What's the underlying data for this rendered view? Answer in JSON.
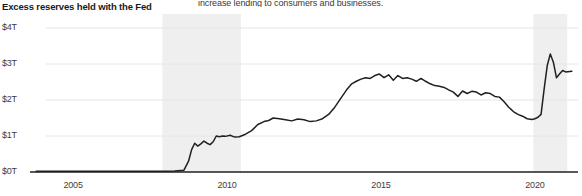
{
  "chart_data": {
    "type": "line",
    "title": "Excess reserves held with the Fed",
    "side_note": "increase lending to consumers and businesses.",
    "xlabel": "",
    "ylabel": "",
    "xlim": [
      2003.6,
      2021.4
    ],
    "ylim": [
      0,
      4
    ],
    "grid": true,
    "legend": "none",
    "y_ticks": [
      "$0T",
      "$1T",
      "$2T",
      "$3T",
      "$4T"
    ],
    "y_tick_values": [
      0,
      1,
      2,
      3,
      4
    ],
    "x_ticks": [
      "2005",
      "2010",
      "2015",
      "2020"
    ],
    "x_tick_values": [
      2005,
      2010,
      2015,
      2020
    ],
    "line_color": "#231f20",
    "grid_color": "#e6e6e6",
    "axis_color": "#231f20",
    "recession_band_color": "#efefef",
    "recession_bands": [
      {
        "start": 2007.9,
        "end": 2010.45
      },
      {
        "start": 2019.95,
        "end": 2021.05
      }
    ],
    "series": [
      {
        "name": "Excess reserves held with the Fed",
        "units": "trillions of USD",
        "x": [
          2003.8,
          2004.2,
          2004.7,
          2005.2,
          2005.7,
          2006.2,
          2006.7,
          2007.2,
          2007.7,
          2008.0,
          2008.3,
          2008.6,
          2008.75,
          2008.85,
          2008.95,
          2009.05,
          2009.15,
          2009.25,
          2009.35,
          2009.45,
          2009.55,
          2009.65,
          2009.75,
          2009.85,
          2009.95,
          2010.1,
          2010.25,
          2010.4,
          2010.6,
          2010.8,
          2011.0,
          2011.2,
          2011.35,
          2011.5,
          2011.7,
          2011.9,
          2012.1,
          2012.3,
          2012.5,
          2012.7,
          2012.9,
          2013.1,
          2013.3,
          2013.5,
          2013.7,
          2013.9,
          2014.05,
          2014.2,
          2014.35,
          2014.5,
          2014.65,
          2014.8,
          2014.95,
          2015.1,
          2015.25,
          2015.4,
          2015.55,
          2015.7,
          2015.85,
          2016.0,
          2016.15,
          2016.3,
          2016.45,
          2016.6,
          2016.75,
          2016.9,
          2017.05,
          2017.2,
          2017.35,
          2017.5,
          2017.65,
          2017.8,
          2017.95,
          2018.1,
          2018.25,
          2018.4,
          2018.55,
          2018.7,
          2018.85,
          2019.0,
          2019.15,
          2019.3,
          2019.45,
          2019.6,
          2019.75,
          2019.9,
          2020.0,
          2020.1,
          2020.2,
          2020.3,
          2020.4,
          2020.5,
          2020.6,
          2020.7,
          2020.8,
          2020.9,
          2021.0,
          2021.2
        ],
        "y": [
          0.02,
          0.02,
          0.02,
          0.02,
          0.02,
          0.02,
          0.02,
          0.02,
          0.02,
          0.02,
          0.03,
          0.05,
          0.3,
          0.62,
          0.8,
          0.72,
          0.78,
          0.86,
          0.8,
          0.76,
          0.84,
          1.0,
          0.98,
          1.0,
          0.99,
          1.02,
          0.97,
          0.98,
          1.05,
          1.15,
          1.32,
          1.4,
          1.43,
          1.5,
          1.48,
          1.45,
          1.42,
          1.47,
          1.45,
          1.4,
          1.42,
          1.48,
          1.6,
          1.8,
          2.05,
          2.3,
          2.45,
          2.52,
          2.58,
          2.62,
          2.6,
          2.68,
          2.72,
          2.62,
          2.7,
          2.55,
          2.68,
          2.6,
          2.62,
          2.58,
          2.52,
          2.6,
          2.52,
          2.45,
          2.4,
          2.38,
          2.35,
          2.28,
          2.22,
          2.1,
          2.25,
          2.18,
          2.24,
          2.22,
          2.14,
          2.2,
          2.18,
          2.1,
          2.08,
          1.95,
          1.8,
          1.68,
          1.6,
          1.55,
          1.48,
          1.46,
          1.48,
          1.52,
          1.6,
          2.3,
          2.95,
          3.28,
          3.05,
          2.62,
          2.72,
          2.82,
          2.78,
          2.8
        ]
      }
    ]
  }
}
